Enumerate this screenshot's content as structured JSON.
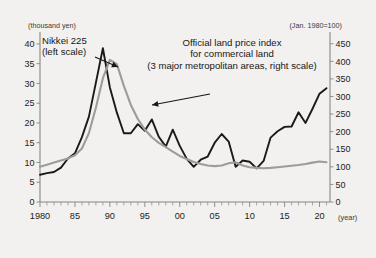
{
  "chart_data": {
    "type": "line",
    "title": "",
    "xlabel": "(year)",
    "left_axis": {
      "unit_label": "(thousand yen)",
      "ticks": [
        0,
        5,
        10,
        15,
        20,
        25,
        30,
        35,
        40
      ],
      "ylim": [
        0,
        42
      ]
    },
    "right_axis": {
      "unit_label": "(Jan. 1980=100)",
      "ticks": [
        0,
        50,
        100,
        150,
        200,
        250,
        300,
        350,
        400,
        450
      ],
      "ylim": [
        0,
        472
      ]
    },
    "x": {
      "major_ticks": [
        1980,
        1985,
        1990,
        1995,
        2000,
        2005,
        2010,
        2015,
        2020
      ],
      "major_labels": [
        "1980",
        "85",
        "90",
        "95",
        "00",
        "05",
        "10",
        "15",
        "20"
      ],
      "minor_step": 1,
      "xlim": [
        1980,
        2021.5
      ]
    },
    "grid": false,
    "legend_position": "inline-annotation",
    "series": [
      {
        "name": "Nikkei 225 (left scale)",
        "axis": "left",
        "color": "#1a1a18",
        "unit": "thousand yen",
        "x": [
          1980,
          1981,
          1982,
          1983,
          1984,
          1985,
          1986,
          1987,
          1988,
          1989,
          1990,
          1991,
          1992,
          1993,
          1994,
          1995,
          1996,
          1997,
          1998,
          1999,
          2000,
          2001,
          2002,
          2003,
          2004,
          2005,
          2006,
          2007,
          2008,
          2009,
          2010,
          2011,
          2012,
          2013,
          2014,
          2015,
          2016,
          2017,
          2018,
          2019,
          2020,
          2021
        ],
        "values": [
          6.9,
          7.3,
          7.6,
          8.7,
          11.0,
          12.3,
          16.4,
          21.6,
          30.2,
          38.9,
          29.0,
          22.6,
          17.4,
          17.4,
          19.7,
          18.0,
          20.9,
          16.5,
          14.0,
          18.3,
          14.2,
          10.9,
          8.9,
          10.7,
          11.5,
          15.0,
          17.2,
          15.3,
          8.9,
          10.5,
          10.2,
          8.5,
          10.4,
          16.3,
          17.9,
          19.0,
          19.1,
          22.7,
          20.0,
          23.6,
          27.4,
          28.8
        ]
      },
      {
        "name": "Official land price index for commercial land (3 major metropolitan areas, right scale)",
        "axis": "right",
        "color": "#9d9d97",
        "unit": "index, Jan. 1980 = 100",
        "x": [
          1980,
          1981,
          1982,
          1983,
          1984,
          1985,
          1986,
          1987,
          1988,
          1989,
          1990,
          1991,
          1992,
          1993,
          1994,
          1995,
          1996,
          1997,
          1998,
          1999,
          2000,
          2001,
          2002,
          2003,
          2004,
          2005,
          2006,
          2007,
          2008,
          2009,
          2010,
          2011,
          2012,
          2013,
          2014,
          2015,
          2016,
          2017,
          2018,
          2019,
          2020,
          2021
        ],
        "values": [
          100,
          106,
          112,
          118,
          124,
          133,
          152,
          196,
          268,
          352,
          404,
          392,
          330,
          276,
          236,
          206,
          184,
          168,
          156,
          143,
          131,
          122,
          114,
          108,
          104,
          102,
          104,
          110,
          113,
          104,
          99,
          97,
          96,
          97,
          99,
          101,
          103,
          105,
          108,
          112,
          115,
          113
        ]
      }
    ],
    "annotations": [
      {
        "id": "nikkei-label",
        "lines": [
          "Nikkei 225",
          "(left scale)"
        ],
        "x": 42,
        "y": 44,
        "anchor": "start",
        "arrow": {
          "x1": 95,
          "y1": 57,
          "x2": 118,
          "y2": 67
        }
      },
      {
        "id": "land-price-label",
        "lines": [
          "Official land price index",
          "for commercial land",
          "(3 major metropolitan areas, right scale)"
        ],
        "x": 232,
        "y": 46,
        "anchor": "middle",
        "arrow": {
          "x1": 210,
          "y1": 94,
          "x2": 152,
          "y2": 105
        }
      }
    ]
  }
}
